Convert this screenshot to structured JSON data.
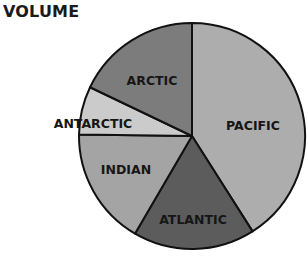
{
  "chart_data": {
    "type": "pie",
    "title": "VOLUME",
    "start_angle_deg": -90,
    "direction": "clockwise",
    "slices": [
      {
        "label": "PACIFIC",
        "value": 41,
        "color": "#adadad",
        "label_pos": [
          253,
          126
        ]
      },
      {
        "label": "ATLANTIC",
        "value": 17.4,
        "color": "#5c5c5c",
        "label_pos": [
          193,
          220
        ]
      },
      {
        "label": "INDIAN",
        "value": 16.8,
        "color": "#a4a4a4",
        "label_pos": [
          126,
          170
        ]
      },
      {
        "label": "ANTARCTIC",
        "value": 6.9,
        "color": "#cbcbcb",
        "label_pos": [
          93,
          124
        ]
      },
      {
        "label": "ARCTIC",
        "value": 17.9,
        "color": "#7c7c7c",
        "label_pos": [
          152,
          81
        ]
      }
    ],
    "center": [
      192,
      136
    ],
    "radius": 113,
    "legend": "none",
    "units": "approximate percent of total volume (estimated from slice angles)"
  }
}
